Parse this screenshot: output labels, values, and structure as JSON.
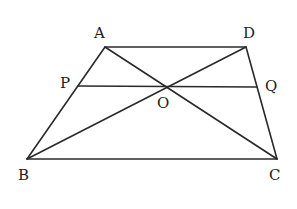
{
  "diagram": {
    "points": {
      "A": {
        "label": "A",
        "x": 105,
        "y": 47,
        "lx": 94,
        "ly": 38
      },
      "D": {
        "label": "D",
        "x": 246,
        "y": 47,
        "lx": 243,
        "ly": 38
      },
      "P": {
        "label": "P",
        "x": 78,
        "y": 86,
        "lx": 60,
        "ly": 88
      },
      "Q": {
        "label": "Q",
        "x": 257,
        "y": 87,
        "lx": 265,
        "ly": 91
      },
      "O": {
        "label": "O",
        "x": 165,
        "y": 87,
        "lx": 157,
        "ly": 108
      },
      "B": {
        "label": "B",
        "x": 27,
        "y": 159,
        "lx": 18,
        "ly": 180
      },
      "C": {
        "label": "C",
        "x": 277,
        "y": 159,
        "lx": 269,
        "ly": 180
      }
    },
    "segments": [
      {
        "name": "AD",
        "from": "A",
        "to": "D"
      },
      {
        "name": "AB",
        "from": "A",
        "to": "B"
      },
      {
        "name": "DC",
        "from": "D",
        "to": "C"
      },
      {
        "name": "BC",
        "from": "B",
        "to": "C"
      },
      {
        "name": "AC",
        "from": "A",
        "to": "C"
      },
      {
        "name": "BD",
        "from": "B",
        "to": "D"
      },
      {
        "name": "PQ",
        "from": "P",
        "to": "Q"
      }
    ],
    "line_color": "#2a2a2a"
  }
}
